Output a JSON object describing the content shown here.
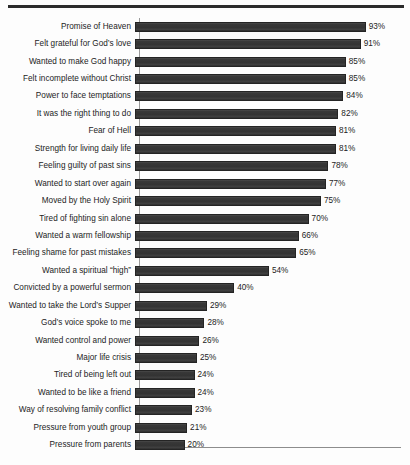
{
  "figure": {
    "top_rule": "horizontal-rule",
    "background_color": "#fdfdfd",
    "bar_color": "#383838",
    "axis_color": "#8d8d8d"
  },
  "chart_data": {
    "type": "bar",
    "orientation": "horizontal",
    "title": "",
    "subtitle": "",
    "xlabel": "",
    "ylabel": "",
    "xlim": [
      0,
      100
    ],
    "grid": false,
    "legend": false,
    "value_suffix": "%",
    "categories": [
      "Promise of Heaven",
      "Felt grateful for God’s love",
      "Wanted to make God happy",
      "Felt incomplete without Christ",
      "Power to face temptations",
      "It was the right thing to do",
      "Fear of Hell",
      "Strength for living daily life",
      "Feeling guilty of past sins",
      "Wanted to start over again",
      "Moved by the Holy Spirit",
      "Tired of fighting sin alone",
      "Wanted a warm fellowship",
      "Feeling shame for past mistakes",
      "Wanted a spiritual “high”",
      "Convicted by a powerful sermon",
      "Wanted to take the Lord’s Supper",
      "God’s voice spoke to me",
      "Wanted control and power",
      "Major life crisis",
      "Tired of being left out",
      "Wanted to be like a friend",
      "Way of resolving family conflict",
      "Pressure  from youth group",
      "Pressure from parents"
    ],
    "values": [
      93,
      91,
      85,
      85,
      84,
      82,
      81,
      81,
      78,
      77,
      75,
      70,
      66,
      65,
      54,
      40,
      29,
      28,
      26,
      25,
      24,
      24,
      23,
      21,
      20
    ],
    "value_labels": [
      "93%",
      "91%",
      "85%",
      "85%",
      "84%",
      "82%",
      "81%",
      "81%",
      "78%",
      "77%",
      "75%",
      "70%",
      "66%",
      "65%",
      "54%",
      "40%",
      "29%",
      "28%",
      "26%",
      "25%",
      "24%",
      "24%",
      "23%",
      "21%",
      "20%"
    ]
  }
}
